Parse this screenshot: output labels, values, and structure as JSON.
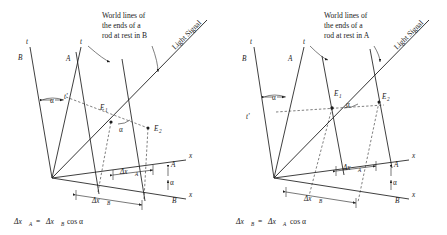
{
  "figure": {
    "background_color": "#ffffff",
    "line_color": "#1d1d1d",
    "panels": [
      {
        "id": "left",
        "annotation": {
          "line1": "World lines of",
          "line2": "the ends of a",
          "line3": "rod at rest in B"
        },
        "light_signal_label": "Light Signal",
        "axes": {
          "t_axis_label": "t",
          "t_axis_frame": "B",
          "t_prime_axis_label": "t",
          "t_prime_axis_frame": "A",
          "t_prime_label": "t'",
          "angle_label": "α",
          "x_axis_upper_label": "x",
          "x_axis_upper_frame": "A",
          "x_axis_lower_label": "x",
          "x_axis_lower_frame": "B",
          "x_angle_label": "α"
        },
        "events": {
          "e1_label": "E",
          "e1_sub": "1",
          "e2_label": "E",
          "e2_sub": "2",
          "event_angle_label": "α"
        },
        "measures": {
          "upper_symbol": "Δx",
          "upper_sub": "A",
          "lower_symbol": "Δx",
          "lower_sub": "B"
        },
        "caption": {
          "lhs_symbol": "Δx",
          "lhs_sub": "A",
          "equals": "=",
          "rhs_symbol": "Δx",
          "rhs_sub": "B",
          "rhs_tail": "cos α"
        }
      },
      {
        "id": "right",
        "annotation": {
          "line1": "World lines of",
          "line2": "the ends of a",
          "line3": "rod at rest in A"
        },
        "light_signal_label": "Light Signal",
        "axes": {
          "t_axis_label": "t",
          "t_axis_frame": "B",
          "t_prime_axis_label": "t",
          "t_prime_axis_frame": "A",
          "t_prime_label": "t'",
          "angle_label": "α",
          "x_axis_upper_label": "x",
          "x_axis_upper_frame": "A",
          "x_axis_lower_label": "x",
          "x_axis_lower_frame": "B",
          "x_angle_label": "α"
        },
        "events": {
          "e1_label": "E",
          "e1_sub": "1",
          "e2_label": "E",
          "e2_sub": "2",
          "event_angle_label": "α"
        },
        "measures": {
          "upper_symbol": "Δx",
          "upper_sub": "A",
          "lower_symbol": "Δx",
          "lower_sub": "B"
        },
        "caption": {
          "lhs_symbol": "Δx",
          "lhs_sub": "B",
          "equals": "=",
          "rhs_symbol": "Δx",
          "rhs_sub": "A",
          "rhs_tail": "cos α"
        }
      }
    ]
  }
}
